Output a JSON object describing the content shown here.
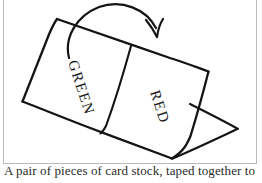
{
  "figure": {
    "frame": {
      "border_color": "#b9b9b9",
      "background": "#ffffff"
    },
    "ink_color": "#141414",
    "panels": [
      {
        "name": "left-panel",
        "label": "GREEN",
        "label_rotation_deg": 72,
        "label_position": {
          "x": 68,
          "y": 62
        }
      },
      {
        "name": "right-panel",
        "label": "RED",
        "label_rotation_deg": 72,
        "label_position": {
          "x": 150,
          "y": 92
        }
      }
    ],
    "annotations": {
      "fold_arrow": {
        "name": "fold-direction-arrow",
        "description": "curved arrow sweeping over the top edge from left panel toward the right, indicating the folding motion",
        "head_direction": "down-right"
      },
      "side_flap": {
        "name": "triangular-side-flap",
        "description": "triangular flap projecting to the right of the standing card"
      }
    },
    "geometry": {
      "big_quad": [
        {
          "x": 57,
          "y": 19
        },
        {
          "x": 208,
          "y": 71
        },
        {
          "x": 172,
          "y": 158
        },
        {
          "x": 23,
          "y": 101
        }
      ],
      "fold_line": [
        {
          "x": 131,
          "y": 46
        },
        {
          "x": 100,
          "y": 133
        }
      ],
      "triangle": [
        {
          "x": 190,
          "y": 104
        },
        {
          "x": 238,
          "y": 129
        },
        {
          "x": 172,
          "y": 158
        }
      ]
    }
  },
  "caption": {
    "text": "A pair of pieces of card stock, taped together to",
    "clipped": true,
    "note": "only the uppermost pixel row of the caption is visible in the screenshot"
  }
}
